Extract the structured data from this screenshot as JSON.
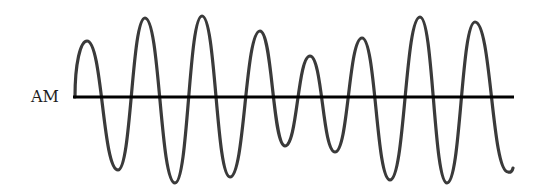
{
  "diagram": {
    "label": "AM",
    "baseline": {
      "y": 97,
      "x_start": 73,
      "x_end": 514,
      "color": "#000000"
    },
    "wave_color": "#3a3a3a",
    "peaks": [
      {
        "x": 87,
        "y": 41
      },
      {
        "x": 145,
        "y": 18
      },
      {
        "x": 202,
        "y": 16
      },
      {
        "x": 260,
        "y": 31
      },
      {
        "x": 310,
        "y": 56
      },
      {
        "x": 362,
        "y": 38
      },
      {
        "x": 420,
        "y": 17
      },
      {
        "x": 475,
        "y": 22
      }
    ],
    "troughs": [
      {
        "x": 118,
        "y": 170
      },
      {
        "x": 175,
        "y": 183
      },
      {
        "x": 230,
        "y": 177
      },
      {
        "x": 285,
        "y": 146
      },
      {
        "x": 335,
        "y": 152
      },
      {
        "x": 390,
        "y": 180
      },
      {
        "x": 447,
        "y": 183
      },
      {
        "x": 508,
        "y": 172
      }
    ]
  }
}
